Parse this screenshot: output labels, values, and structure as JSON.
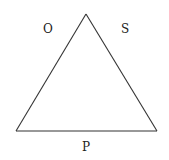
{
  "diagram": {
    "shape": "triangle",
    "stroke_color": "#333333",
    "background": "#ffffff",
    "vertices": {
      "apex": [
        86,
        14
      ],
      "bottom_left": [
        16,
        131
      ],
      "bottom_right": [
        157,
        131
      ]
    },
    "labels": {
      "left_side": "O",
      "right_side": "S",
      "base": "P"
    }
  }
}
